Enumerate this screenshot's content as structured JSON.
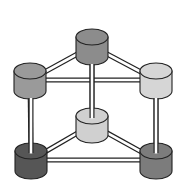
{
  "diagram": {
    "type": "triangular-prism-lattice",
    "background": "#ffffff",
    "stroke": "#222222",
    "nodes": [
      {
        "id": "top-back",
        "cx": 92,
        "cy": 37,
        "rx": 16,
        "ry": 8,
        "h": 20,
        "color": "#8c8c8c"
      },
      {
        "id": "top-left",
        "cx": 30,
        "cy": 71,
        "rx": 16,
        "ry": 8,
        "h": 20,
        "color": "#9a9a9a"
      },
      {
        "id": "top-right",
        "cx": 156,
        "cy": 71,
        "rx": 16,
        "ry": 8,
        "h": 20,
        "color": "#d6d6d6"
      },
      {
        "id": "bottom-back",
        "cx": 92,
        "cy": 116,
        "rx": 16,
        "ry": 8,
        "h": 19,
        "color": "#d0d0d0"
      },
      {
        "id": "bottom-left",
        "cx": 31,
        "cy": 151,
        "rx": 16,
        "ry": 8,
        "h": 20,
        "color": "#565656"
      },
      {
        "id": "bottom-right",
        "cx": 156,
        "cy": 151,
        "rx": 16,
        "ry": 8,
        "h": 20,
        "color": "#7c7c7c"
      }
    ],
    "edges": [
      [
        "top-back",
        "top-left"
      ],
      [
        "top-back",
        "top-right"
      ],
      [
        "top-left",
        "top-right"
      ],
      [
        "bottom-back",
        "bottom-left"
      ],
      [
        "bottom-back",
        "bottom-right"
      ],
      [
        "bottom-left",
        "bottom-right"
      ],
      [
        "top-back",
        "bottom-back"
      ],
      [
        "top-left",
        "bottom-left"
      ],
      [
        "top-right",
        "bottom-right"
      ]
    ]
  }
}
